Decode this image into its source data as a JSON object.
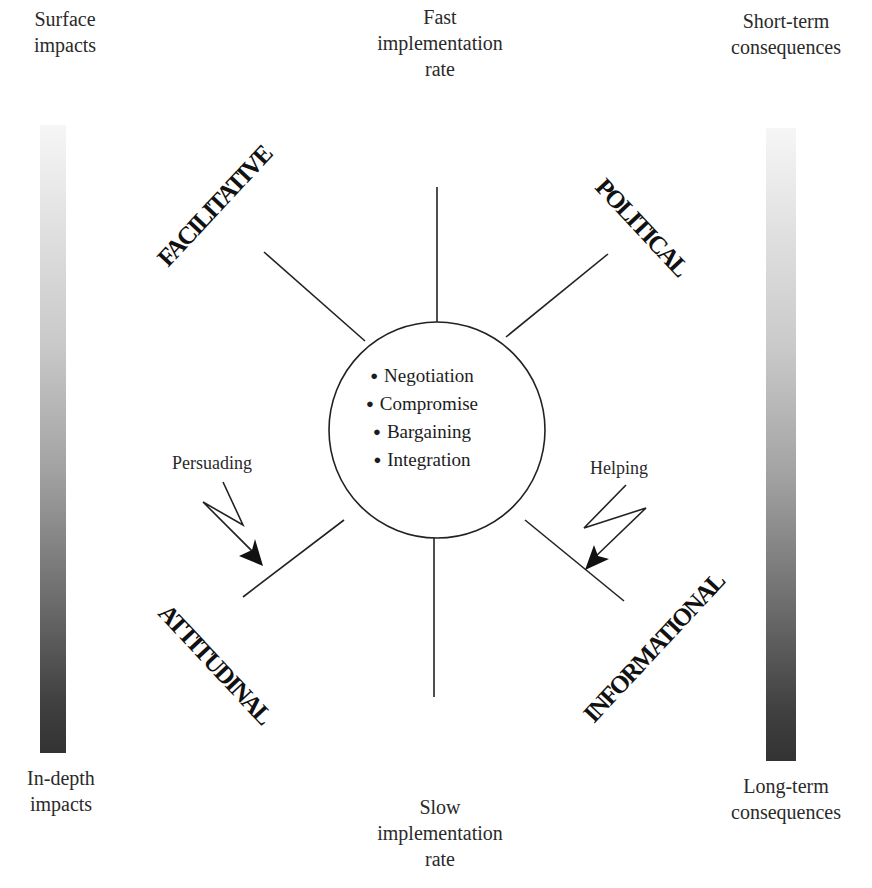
{
  "top_center": {
    "lines": [
      "Fast",
      "implementation",
      "rate"
    ]
  },
  "bottom_center": {
    "lines": [
      "Slow",
      "implementation",
      "rate"
    ]
  },
  "left_scale": {
    "top_label": [
      "Surface",
      "impacts"
    ],
    "bottom_label": [
      "In-depth",
      "impacts"
    ]
  },
  "right_scale": {
    "top_label": [
      "Short-term",
      "consequences"
    ],
    "bottom_label": [
      "Long-term",
      "consequences"
    ]
  },
  "categories": {
    "top_left": "FACILITATIVE",
    "top_right": "POLITICAL",
    "bottom_left": "ATTITUDINAL",
    "bottom_right": "INFORMATIONAL"
  },
  "center": {
    "items": [
      "Negotiation",
      "Compromise",
      "Bargaining",
      "Integration"
    ]
  },
  "arrows": {
    "left": "Persuading",
    "right": "Helping"
  },
  "colors": {
    "line": "#222222",
    "gradient_light": "#f6f6f6",
    "gradient_dark": "#333333"
  }
}
